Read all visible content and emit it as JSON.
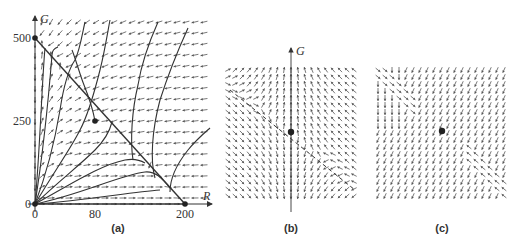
{
  "figure": {
    "panels": [
      {
        "id": "a",
        "label": "(a)",
        "x_axis_label": "R",
        "y_axis_label": "G",
        "x_ticks": [
          "0",
          "80",
          "200"
        ],
        "y_ticks": [
          "0",
          "250",
          "500"
        ],
        "fixed_points": [
          {
            "R": 0,
            "G": 0
          },
          {
            "R": 0,
            "G": 500
          },
          {
            "R": 80,
            "G": 250
          },
          {
            "R": 200,
            "G": 0
          }
        ],
        "nullcline": "line from (0,500) to (200,0)"
      },
      {
        "id": "b",
        "label": "(b)",
        "y_axis_label": "G",
        "description": "zoomed direction field near saddle point, mostly vertical arrows, dashed separatrix"
      },
      {
        "id": "c",
        "label": "(c)",
        "description": "zoomed direction field near saddle point, diagonal arrows, dashed separatrix"
      }
    ]
  },
  "colors": {
    "ink": "#3a3a3a",
    "arrow": "#555555",
    "background": "#ffffff"
  }
}
